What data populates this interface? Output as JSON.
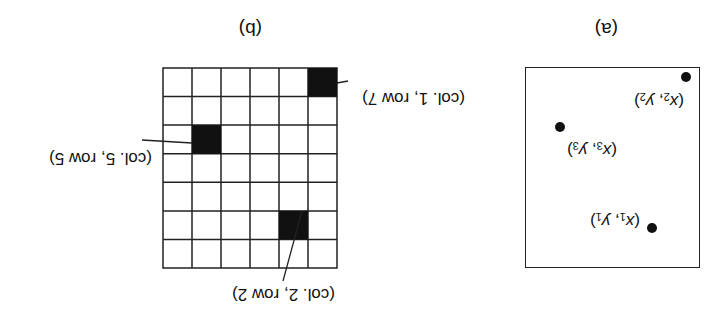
{
  "figure": {
    "orientation": "rotated 180 degrees",
    "panel_a": {
      "caption": "(a)",
      "points": [
        {
          "name": "p1",
          "label_x": "x",
          "label_y": "y",
          "sub": "1",
          "text": "(x1, y1)"
        },
        {
          "name": "p2",
          "label_x": "x",
          "label_y": "y",
          "sub": "2",
          "text": "(x2, y2)"
        },
        {
          "name": "p3",
          "label_x": "x",
          "label_y": "y",
          "sub": "3",
          "text": "(x3, y3)"
        }
      ]
    },
    "panel_b": {
      "caption": "(b)",
      "grid": {
        "cols": 6,
        "rows": 7
      },
      "filled_cells": [
        {
          "col": 1,
          "row": 7,
          "label": "(col. 1, row 7)"
        },
        {
          "col": 5,
          "row": 5,
          "label": "(col. 5, row 5)"
        },
        {
          "col": 2,
          "row": 2,
          "label": "(col. 2, row 2)"
        }
      ]
    }
  }
}
